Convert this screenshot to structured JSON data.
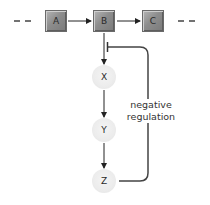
{
  "diagram": {
    "pathway_nodes": [
      {
        "id": "A",
        "label": "A",
        "shape": "square"
      },
      {
        "id": "B",
        "label": "B",
        "shape": "square"
      },
      {
        "id": "C",
        "label": "C",
        "shape": "square"
      }
    ],
    "branch_nodes": [
      {
        "id": "X",
        "label": "X",
        "shape": "circle"
      },
      {
        "id": "Y",
        "label": "Y",
        "shape": "circle"
      },
      {
        "id": "Z",
        "label": "Z",
        "shape": "circle"
      }
    ],
    "edges": [
      {
        "from": "A",
        "to": "B",
        "type": "activation"
      },
      {
        "from": "B",
        "to": "C",
        "type": "activation"
      },
      {
        "from": "B",
        "to": "X",
        "type": "activation"
      },
      {
        "from": "X",
        "to": "Y",
        "type": "activation"
      },
      {
        "from": "Y",
        "to": "Z",
        "type": "activation"
      },
      {
        "from": "Z",
        "to": "B-X link",
        "type": "inhibition"
      }
    ],
    "feedback_label_line1": "negative",
    "feedback_label_line2": "regulation",
    "colors": {
      "box": "#8d8d8d",
      "circle": "#ececec",
      "line": "#333333"
    }
  }
}
